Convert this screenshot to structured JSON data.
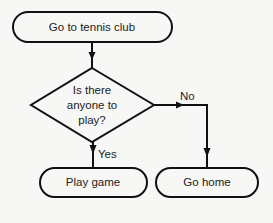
{
  "diagram": {
    "type": "flowchart",
    "nodes": [
      {
        "id": "start",
        "shape": "terminal",
        "text": "Go to tennis club"
      },
      {
        "id": "decision",
        "shape": "decision",
        "lines": [
          "Is there",
          "anyone to",
          "play?"
        ]
      },
      {
        "id": "play",
        "shape": "terminal",
        "text": "Play game"
      },
      {
        "id": "home",
        "shape": "terminal",
        "text": "Go home"
      }
    ],
    "edges": [
      {
        "from": "start",
        "to": "decision",
        "label": ""
      },
      {
        "from": "decision",
        "to": "play",
        "label": "Yes"
      },
      {
        "from": "decision",
        "to": "home",
        "label": "No"
      }
    ]
  }
}
